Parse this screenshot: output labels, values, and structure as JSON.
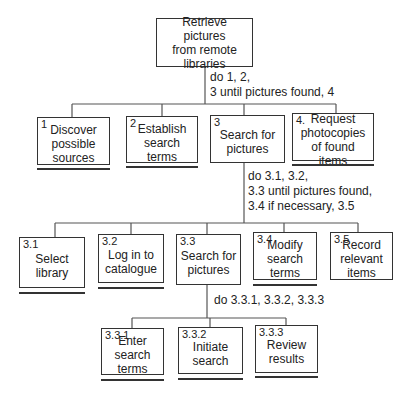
{
  "diagram": {
    "type": "hierarchical-task-analysis",
    "root": {
      "label": "Retrieve pictures\nfrom remote\nlibraries"
    },
    "plans": {
      "p0": "do 1, 2,\n3 until pictures found, 4",
      "p3": "do 3.1, 3.2,\n3.3 until pictures found,\n3.4 if necessary, 3.5",
      "p33": "do 3.3.1, 3.3.2, 3.3.3"
    },
    "level1": [
      {
        "num": "1",
        "label": "Discover\npossible\nsources"
      },
      {
        "num": "2",
        "label": "Establish\nsearch\nterms"
      },
      {
        "num": "3",
        "label": "Search for\npictures"
      },
      {
        "num": "4.",
        "label": "Request\nphotocopies\nof found items"
      }
    ],
    "level2": [
      {
        "num": "3.1",
        "label": "Select\nlibrary"
      },
      {
        "num": "3.2",
        "label": "Log in to\ncatalogue"
      },
      {
        "num": "3.3",
        "label": "Search for\npictures"
      },
      {
        "num": "3.4",
        "label": "Modify\nsearch terms"
      },
      {
        "num": "3.5",
        "label": "Record\nrelevant\nitems"
      }
    ],
    "level3": [
      {
        "num": "3.3.1",
        "label": "Enter search\nterms"
      },
      {
        "num": "3.3.2",
        "label": "Initiate\nsearch"
      },
      {
        "num": "3.3.3",
        "label": "Review\nresults"
      }
    ]
  }
}
